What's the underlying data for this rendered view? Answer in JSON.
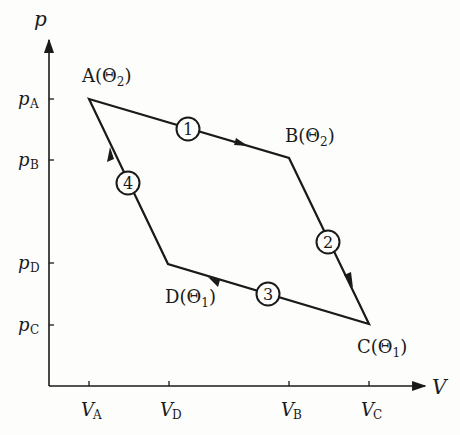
{
  "diagram": {
    "type": "p-V diagram (Carnot cycle)",
    "axes": {
      "y_label": "p",
      "x_label": "V",
      "y_ticks": [
        {
          "base": "p",
          "sub": "A"
        },
        {
          "base": "p",
          "sub": "B"
        },
        {
          "base": "p",
          "sub": "D"
        },
        {
          "base": "p",
          "sub": "C"
        }
      ],
      "x_ticks": [
        {
          "base": "V",
          "sub": "A"
        },
        {
          "base": "V",
          "sub": "D"
        },
        {
          "base": "V",
          "sub": "B"
        },
        {
          "base": "V",
          "sub": "C"
        }
      ]
    },
    "points": [
      {
        "name": "A",
        "temp": "Θ",
        "temp_sub": "2"
      },
      {
        "name": "B",
        "temp": "Θ",
        "temp_sub": "2"
      },
      {
        "name": "C",
        "temp": "Θ",
        "temp_sub": "1"
      },
      {
        "name": "D",
        "temp": "Θ",
        "temp_sub": "1"
      }
    ],
    "processes": [
      "1",
      "2",
      "3",
      "4"
    ],
    "colors": {
      "line": "#1a1a1a",
      "background": "#fdfdfb"
    }
  }
}
